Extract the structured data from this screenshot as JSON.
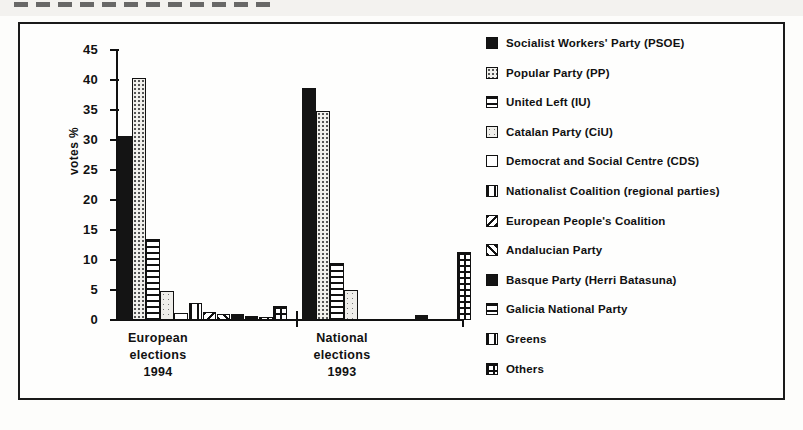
{
  "chart_data": {
    "type": "bar",
    "title": "",
    "subtitle": "",
    "xlabel": "",
    "ylabel": "votes %",
    "ylim": [
      0,
      45
    ],
    "yticks": [
      45,
      40,
      35,
      30,
      25,
      20,
      15,
      10,
      5,
      0
    ],
    "grid": false,
    "legend_position": "right",
    "categories": [
      "European elections 1994",
      "National elections 1993"
    ],
    "category_lines": [
      [
        "European",
        "elections",
        "1994"
      ],
      [
        "National",
        "elections",
        "1993"
      ]
    ],
    "series": [
      {
        "name": "Socialist Workers' Party (PSOE)",
        "pattern": "solid-black",
        "values": [
          30.7,
          38.7
        ]
      },
      {
        "name": "Popular Party (PP)",
        "pattern": "fine-dots",
        "values": [
          40.3,
          34.8
        ]
      },
      {
        "name": "United Left (IU)",
        "pattern": "horizontal-lines",
        "values": [
          13.5,
          9.5
        ]
      },
      {
        "name": "Catalan Party (CiU)",
        "pattern": "light-dots",
        "values": [
          4.8,
          5.0
        ]
      },
      {
        "name": "Democrat and Social Centre (CDS)",
        "pattern": "empty",
        "values": [
          1.1,
          0.0
        ]
      },
      {
        "name": "Nationalist Coalition (regional parties)",
        "pattern": "vertical-bars",
        "values": [
          2.8,
          0.0
        ]
      },
      {
        "name": "European People's Coalition",
        "pattern": "back-hatch",
        "values": [
          1.4,
          0.0
        ]
      },
      {
        "name": "Andalucian Party",
        "pattern": "forward-hatch",
        "values": [
          1.0,
          0.0
        ]
      },
      {
        "name": "Basque Party (Herri Batasuna)",
        "pattern": "solid-black",
        "values": [
          1.0,
          0.8
        ]
      },
      {
        "name": "Galicia National Party",
        "pattern": "horizontal-lines",
        "values": [
          0.6,
          0.0
        ]
      },
      {
        "name": "Greens",
        "pattern": "vertical-bars",
        "values": [
          0.5,
          0.0
        ]
      },
      {
        "name": "Others",
        "pattern": "grid",
        "values": [
          2.4,
          11.3
        ]
      }
    ]
  },
  "axis": {
    "y_label": "votes %",
    "ticks": [
      "45",
      "40",
      "35",
      "30",
      "25",
      "20",
      "15",
      "10",
      "5",
      "0"
    ]
  },
  "legend": {
    "items": [
      {
        "label": "Socialist Workers' Party (PSOE)"
      },
      {
        "label": "Popular Party (PP)"
      },
      {
        "label": "United Left (IU)"
      },
      {
        "label": "Catalan Party (CiU)"
      },
      {
        "label": "Democrat and Social Centre (CDS)"
      },
      {
        "label": "Nationalist Coalition (regional parties)"
      },
      {
        "label": "European People's Coalition"
      },
      {
        "label": "Andalucian Party"
      },
      {
        "label": "Basque Party (Herri Batasuna)"
      },
      {
        "label": "Galicia National Party"
      },
      {
        "label": "Greens"
      },
      {
        "label": "Others"
      }
    ]
  },
  "groups": [
    {
      "line1": "European",
      "line2": "elections",
      "line3": "1994"
    },
    {
      "line1": "National",
      "line2": "elections",
      "line3": "1993"
    }
  ]
}
